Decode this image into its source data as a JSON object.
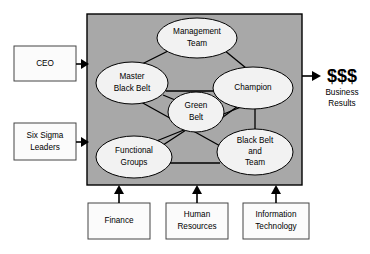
{
  "diagram": {
    "panel": {
      "label": "six-sigma-deployment-panel",
      "fill_color": "#a8a8a8",
      "x": 87,
      "y": 14,
      "width": 215,
      "height": 171
    },
    "nodes": [
      {
        "id": "management-team",
        "label_lines": [
          "Management",
          "Team"
        ],
        "cx": 197,
        "cy": 38,
        "rx": 40,
        "ry": 20
      },
      {
        "id": "master-black-belt",
        "label_lines": [
          "Master",
          "Black Belt"
        ],
        "cx": 132,
        "cy": 83,
        "rx": 36,
        "ry": 21
      },
      {
        "id": "champion",
        "label_lines": [
          "Champion"
        ],
        "cx": 253,
        "cy": 88,
        "rx": 40,
        "ry": 21
      },
      {
        "id": "green-belt",
        "label_lines": [
          "Green",
          "Belt"
        ],
        "cx": 196,
        "cy": 112,
        "rx": 28,
        "ry": 20
      },
      {
        "id": "functional-groups",
        "label_lines": [
          "Functional",
          "Groups"
        ],
        "cx": 134,
        "cy": 157,
        "rx": 38,
        "ry": 21
      },
      {
        "id": "black-belt-team",
        "label_lines": [
          "Black Belt",
          "and",
          "Team"
        ],
        "cx": 255,
        "cy": 152,
        "rx": 38,
        "ry": 23
      }
    ],
    "links": [
      {
        "from": "management-team",
        "to": "master-black-belt"
      },
      {
        "from": "management-team",
        "to": "champion"
      },
      {
        "from": "master-black-belt",
        "to": "champion"
      },
      {
        "from": "master-black-belt",
        "to": "green-belt"
      },
      {
        "from": "green-belt",
        "to": "champion"
      },
      {
        "from": "master-black-belt",
        "to": "black-belt-team"
      },
      {
        "from": "functional-groups",
        "to": "green-belt"
      },
      {
        "from": "functional-groups",
        "to": "champion"
      },
      {
        "from": "functional-groups",
        "to": "black-belt-team"
      },
      {
        "from": "champion",
        "to": "black-belt-team"
      }
    ],
    "input_boxes_left": [
      {
        "id": "ceo",
        "label_lines": [
          "CEO"
        ],
        "x": 14,
        "y": 46,
        "width": 62,
        "height": 35
      },
      {
        "id": "six-sigma-leaders",
        "label_lines": [
          "Six Sigma",
          "Leaders"
        ],
        "x": 14,
        "y": 123,
        "width": 62,
        "height": 37
      }
    ],
    "input_boxes_bottom": [
      {
        "id": "finance",
        "label_lines": [
          "Finance"
        ],
        "x": 88,
        "y": 203,
        "width": 62,
        "height": 36
      },
      {
        "id": "human-resources",
        "label_lines": [
          "Human",
          "Resources"
        ],
        "x": 166,
        "y": 203,
        "width": 62,
        "height": 36
      },
      {
        "id": "information-technology",
        "label_lines": [
          "Information",
          "Technology"
        ],
        "x": 243,
        "y": 203,
        "width": 66,
        "height": 36
      }
    ],
    "output": {
      "id": "business-results",
      "money_label": "$$$",
      "caption_lines": [
        "Business",
        "Results"
      ],
      "x": 337,
      "y": 76
    }
  }
}
